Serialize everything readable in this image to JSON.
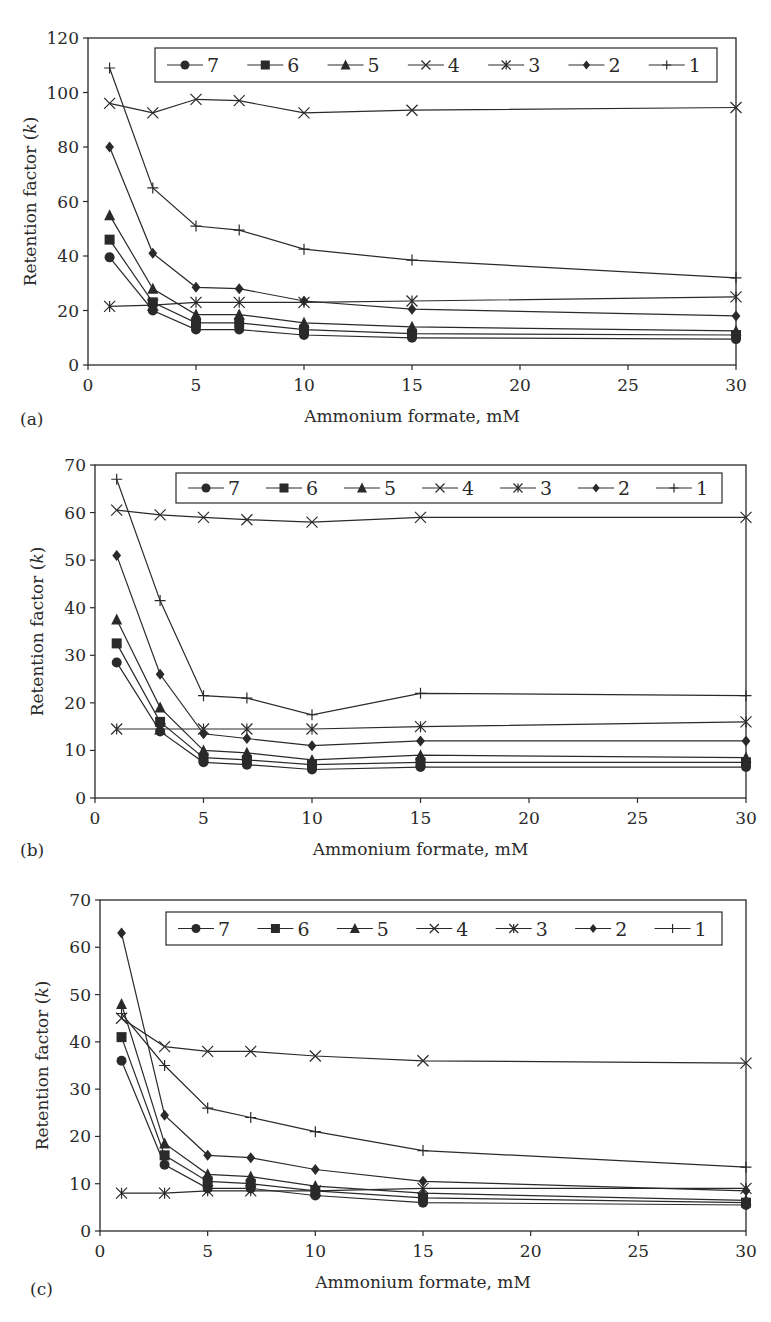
{
  "chart_data": [
    {
      "type": "line",
      "panel_label": "(a)",
      "xlabel": "Ammonium formate, mM",
      "ylabel": "Retention factor (k)",
      "xlim": [
        0,
        30
      ],
      "ylim": [
        0,
        120
      ],
      "xticks": [
        0,
        5,
        10,
        15,
        20,
        25,
        30
      ],
      "yticks": [
        0,
        20,
        40,
        60,
        80,
        100,
        120
      ],
      "grid": false,
      "legend_position": "top, inside",
      "x": [
        1,
        3,
        5,
        7,
        10,
        15,
        30
      ],
      "series": [
        {
          "name": "7",
          "marker": "circle",
          "values": [
            39.5,
            20,
            13,
            13,
            11,
            10,
            9.5
          ]
        },
        {
          "name": "6",
          "marker": "square",
          "values": [
            46,
            23,
            15.5,
            15.5,
            13,
            11.5,
            11
          ]
        },
        {
          "name": "5",
          "marker": "triangle",
          "values": [
            55,
            28,
            18.5,
            18.5,
            15.5,
            14,
            12.5
          ]
        },
        {
          "name": "4",
          "marker": "x",
          "values": [
            96,
            92.5,
            97.5,
            97,
            92.5,
            93.5,
            94.5
          ]
        },
        {
          "name": "3",
          "marker": "asterisk",
          "values": [
            21.5,
            22,
            23,
            23,
            23,
            23.5,
            25
          ]
        },
        {
          "name": "2",
          "marker": "diamond",
          "values": [
            80,
            41,
            28.5,
            28,
            23.5,
            20.5,
            18
          ]
        },
        {
          "name": "1",
          "marker": "plus",
          "values": [
            109,
            65,
            51,
            49.5,
            42.5,
            38.5,
            32
          ]
        }
      ]
    },
    {
      "type": "line",
      "panel_label": "(b)",
      "xlabel": "Ammonium formate, mM",
      "ylabel": "Retention factor (k)",
      "xlim": [
        0,
        30
      ],
      "ylim": [
        0,
        70
      ],
      "xticks": [
        0,
        5,
        10,
        15,
        20,
        25,
        30
      ],
      "yticks": [
        0,
        10,
        20,
        30,
        40,
        50,
        60,
        70
      ],
      "grid": false,
      "legend_position": "top, inside",
      "x": [
        1,
        3,
        5,
        7,
        10,
        15,
        30
      ],
      "series": [
        {
          "name": "7",
          "marker": "circle",
          "values": [
            28.5,
            14,
            7.5,
            7,
            6,
            6.5,
            6.5
          ]
        },
        {
          "name": "6",
          "marker": "square",
          "values": [
            32.5,
            16,
            8.5,
            8,
            7,
            7.5,
            7.5
          ]
        },
        {
          "name": "5",
          "marker": "triangle",
          "values": [
            37.5,
            19,
            10,
            9.5,
            8,
            9,
            8.5
          ]
        },
        {
          "name": "4",
          "marker": "x",
          "values": [
            60.5,
            59.5,
            59,
            58.5,
            58,
            59,
            59
          ]
        },
        {
          "name": "3",
          "marker": "asterisk",
          "values": [
            14.5,
            14.5,
            14.5,
            14.5,
            14.5,
            15,
            16
          ]
        },
        {
          "name": "2",
          "marker": "diamond",
          "values": [
            51,
            26,
            13.5,
            12.5,
            11,
            12,
            12
          ]
        },
        {
          "name": "1",
          "marker": "plus",
          "values": [
            67,
            41.5,
            21.5,
            21,
            17.5,
            22,
            21.5
          ]
        }
      ]
    },
    {
      "type": "line",
      "panel_label": "(c)",
      "xlabel": "Ammonium formate, mM",
      "ylabel": "Retention factor (k)",
      "xlim": [
        0,
        30
      ],
      "ylim": [
        0,
        70
      ],
      "xticks": [
        0,
        5,
        10,
        15,
        20,
        25,
        30
      ],
      "yticks": [
        0,
        10,
        20,
        30,
        40,
        50,
        60,
        70
      ],
      "grid": false,
      "legend_position": "top, inside",
      "x": [
        1,
        3,
        5,
        7,
        10,
        15,
        30
      ],
      "series": [
        {
          "name": "7",
          "marker": "circle",
          "values": [
            36,
            14,
            9,
            9,
            7.5,
            6,
            5.5
          ]
        },
        {
          "name": "6",
          "marker": "square",
          "values": [
            41,
            16,
            10.5,
            10,
            8.5,
            7,
            6
          ]
        },
        {
          "name": "5",
          "marker": "triangle",
          "values": [
            48,
            18.5,
            12,
            11.5,
            9.5,
            8,
            6.5
          ]
        },
        {
          "name": "4",
          "marker": "x",
          "values": [
            45,
            39,
            38,
            38,
            37,
            36,
            35.5
          ]
        },
        {
          "name": "3",
          "marker": "asterisk",
          "values": [
            8,
            8,
            8.5,
            8.5,
            8.5,
            9,
            9
          ]
        },
        {
          "name": "2",
          "marker": "diamond",
          "values": [
            63,
            24.5,
            16,
            15.5,
            13,
            10.5,
            8.5
          ]
        },
        {
          "name": "1",
          "marker": "plus",
          "values": [
            46,
            35,
            26,
            24,
            21,
            17,
            13.5
          ]
        }
      ]
    }
  ],
  "panels": [
    {
      "label": "(a)",
      "xlabel": "Ammonium formate, mM",
      "ylabel": "Retention factor (k)"
    },
    {
      "label": "(b)",
      "xlabel": "Ammonium formate, mM",
      "ylabel": "Retention factor (k)"
    },
    {
      "label": "(c)",
      "xlabel": "Ammonium formate, mM",
      "ylabel": "Retention factor (k)"
    }
  ],
  "legend_order": [
    "7",
    "6",
    "5",
    "4",
    "3",
    "2",
    "1"
  ]
}
